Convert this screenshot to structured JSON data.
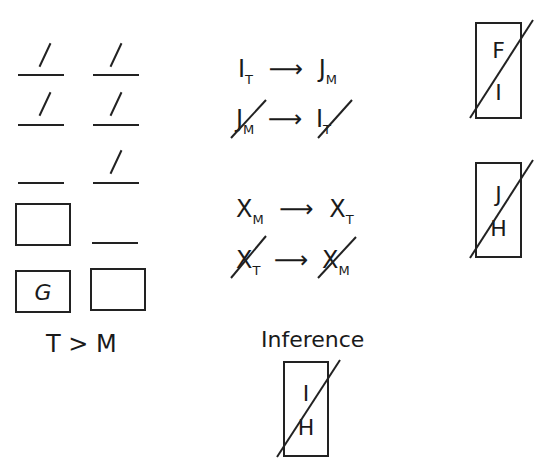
{
  "game_board": {
    "column_T": {
      "slots": [
        {
          "type": "slot",
          "has_slash": true
        },
        {
          "type": "slot",
          "has_slash": true
        },
        {
          "type": "slot",
          "has_slash": false
        },
        {
          "type": "box",
          "letter": ""
        },
        {
          "type": "box",
          "letter": "G"
        }
      ]
    },
    "column_M": {
      "slots": [
        {
          "type": "slot",
          "has_slash": true
        },
        {
          "type": "slot",
          "has_slash": true
        },
        {
          "type": "slot",
          "has_slash": true
        },
        {
          "type": "slot",
          "has_slash": false
        },
        {
          "type": "box",
          "letter": ""
        }
      ]
    },
    "ordering_rule": "T > M"
  },
  "rules": [
    {
      "from": "I",
      "from_sub": "T",
      "to": "J",
      "to_sub": "M",
      "negated": false
    },
    {
      "from": "J",
      "from_sub": "M",
      "to": "I",
      "to_sub": "T",
      "negated": true
    },
    {
      "from": "X",
      "from_sub": "M",
      "to": "X",
      "to_sub": "T",
      "negated": false
    },
    {
      "from": "X",
      "from_sub": "T",
      "to": "X",
      "to_sub": "M",
      "negated": true
    }
  ],
  "arrow": "⟶",
  "not_together_blocks": [
    {
      "top": "F",
      "bottom": "I"
    },
    {
      "top": "J",
      "bottom": "H"
    }
  ],
  "inference": {
    "label": "Inference",
    "top": "I",
    "bottom": "H"
  }
}
